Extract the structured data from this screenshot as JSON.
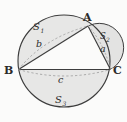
{
  "figure": {
    "background_color": "#fbfbfa",
    "stroke_color": "#3a3a3a",
    "fill_color": "#e6e6e6",
    "dashed_color": "#9a9a9a",
    "vertices": [
      {
        "id": "B",
        "label": "B",
        "x": 18.5,
        "y": 69.5
      },
      {
        "id": "A",
        "label": "A",
        "x": 88.0,
        "y": 26.0
      },
      {
        "id": "C",
        "label": "C",
        "x": 110.5,
        "y": 69.5
      }
    ],
    "sides": [
      {
        "id": "b",
        "label": "b",
        "between": "B-A",
        "label_x": 40.0,
        "label_y": 44.5
      },
      {
        "id": "a",
        "label": "a",
        "between": "A-C",
        "label_x": 102.0,
        "label_y": 49.0
      },
      {
        "id": "c",
        "label": "c",
        "between": "B-C",
        "label_x": 61.0,
        "label_y": 80.0
      }
    ],
    "regions": [
      {
        "id": "S1",
        "label": "S",
        "subscript": "1",
        "on_side": "b",
        "label_x": 38.0,
        "label_y": 27.0
      },
      {
        "id": "S2",
        "label": "S",
        "subscript": "2",
        "on_side": "a",
        "label_x": 104.0,
        "label_y": 36.0
      },
      {
        "id": "S3",
        "label": "S",
        "subscript": "3",
        "on_side": "c",
        "label_x": 60.0,
        "label_y": 100.0
      }
    ],
    "main_circle": {
      "cx": 64.0,
      "cy": 61.0,
      "r": 46.0
    },
    "semicircle_a": {
      "cx": 99.25,
      "cy": 47.75,
      "r": 24.4
    }
  }
}
